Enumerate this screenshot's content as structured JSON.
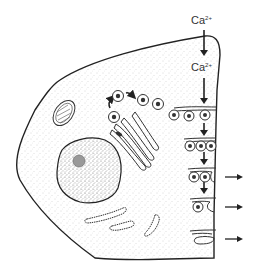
{
  "diagram": {
    "type": "cell-secretion-schematic",
    "labels": {
      "ion_outside": "Ca",
      "ion_outside_charge": "2+",
      "ion_inside": "Ca",
      "ion_inside_charge": "2+"
    },
    "structures": [
      {
        "name": "cell-membrane"
      },
      {
        "name": "nucleus",
        "contains": [
          "nucleolus"
        ]
      },
      {
        "name": "mitochondrion"
      },
      {
        "name": "golgi-apparatus"
      },
      {
        "name": "secretory-vesicles",
        "count": 4
      },
      {
        "name": "endoplasmic-reticulum-fragments",
        "count": 3
      },
      {
        "name": "exocytosis-sites",
        "count": 4
      }
    ],
    "colors": {
      "line": "#222222",
      "stipple": "#9a9a9a",
      "background": "#ffffff"
    }
  }
}
